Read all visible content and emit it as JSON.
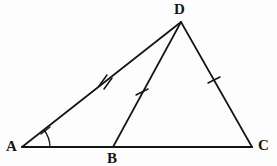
{
  "figure": {
    "background_color": "#fdfdfd",
    "stroke_color": "#141414",
    "labels": {
      "A": "A",
      "B": "B",
      "C": "C",
      "D": "D"
    },
    "points": {
      "A": {
        "x": 22,
        "y": 147
      },
      "B": {
        "x": 113,
        "y": 147
      },
      "C": {
        "x": 252,
        "y": 147
      },
      "D": {
        "x": 181,
        "y": 22
      }
    },
    "segments": [
      {
        "name": "AC",
        "from": "A",
        "to": "C",
        "ticks": 0
      },
      {
        "name": "AD",
        "from": "A",
        "to": "D",
        "ticks": 2
      },
      {
        "name": "BD",
        "from": "B",
        "to": "D",
        "ticks": 1
      },
      {
        "name": "DC",
        "from": "D",
        "to": "C",
        "ticks": 1
      }
    ],
    "tick_marks": [
      {
        "on": "AD",
        "count": 2,
        "x": 105,
        "y": 81
      },
      {
        "on": "BD",
        "count": 1,
        "x": 142,
        "y": 92
      },
      {
        "on": "DC",
        "count": 1,
        "x": 214,
        "y": 80
      }
    ],
    "angle_marks": [
      {
        "at": "A",
        "between": "AC and AD",
        "arc_radius": 26,
        "ticks": 1
      }
    ]
  }
}
